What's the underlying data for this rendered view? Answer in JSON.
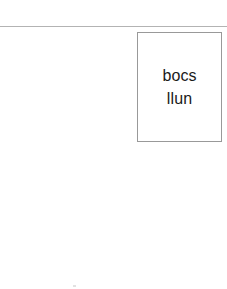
{
  "page": {
    "width": 227,
    "height": 289,
    "background_color": "#ffffff"
  },
  "top_rule": {
    "color": "#b3b3b3"
  },
  "picture_box": {
    "border_color": "#999999",
    "fill_color": "#ffffff",
    "text_color": "#1a1a1a",
    "lines": [
      "bocs",
      "llun"
    ]
  },
  "artifact": {
    "color": "#e2e2e2"
  }
}
